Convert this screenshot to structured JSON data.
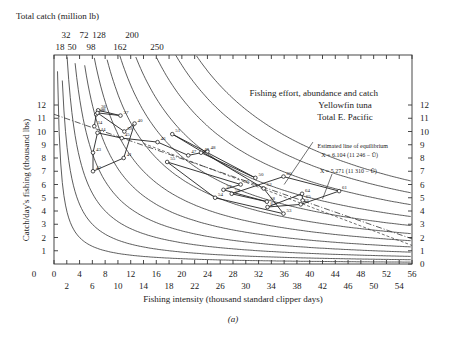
{
  "chart_data": {
    "type": "scatter",
    "title": "Fishing effort, abundance and catch",
    "subtitle": [
      "Yellowfin tuna",
      "Total E. Pacific"
    ],
    "xlabel": "Fishing intensity (thousand standard clipper days)",
    "ylabel": "Catch/day's fishing (thousand lbs)",
    "top_axis_label": "Total catch (million lb)",
    "caption": "(a)",
    "xlim": [
      0,
      56
    ],
    "ylim": [
      0,
      12.5
    ],
    "x_ticks_major_row1": [
      "0",
      "4",
      "8",
      "12",
      "16",
      "20",
      "24",
      "28",
      "32",
      "36",
      "40",
      "44",
      "48",
      "52",
      "56"
    ],
    "x_ticks_major_row2": [
      "2",
      "6",
      "10",
      "14",
      "18",
      "22",
      "26",
      "30",
      "34",
      "38",
      "42",
      "46",
      "50",
      "54"
    ],
    "y_ticks_left": [
      "1",
      "2",
      "3",
      "4",
      "5",
      "6",
      "7",
      "8",
      "9",
      "10",
      "11",
      "12"
    ],
    "y_ticks_right": [
      "0",
      "1",
      "2",
      "3",
      "4",
      "5",
      "6",
      "7",
      "8",
      "9",
      "10",
      "11",
      "12"
    ],
    "top_ticks_row1": [
      "32",
      "72",
      "128",
      "200"
    ],
    "top_ticks_row2": [
      "18",
      "50",
      "98",
      "162",
      "250"
    ],
    "isopleths_total_catch": [
      8,
      18,
      32,
      50,
      72,
      98,
      128,
      162,
      200,
      250,
      300,
      350
    ],
    "equilibrium_lines": {
      "title": "Estimated line of equilibrium",
      "line1": "X = 6.104 (11 246 − Ū)",
      "line2": "X = 5.271 (11 310 − Ū)"
    },
    "points": [
      {
        "year": "34",
        "x": 6.3,
        "y": 10.4
      },
      {
        "year": "35",
        "x": 6.6,
        "y": 11.3
      },
      {
        "year": "36",
        "x": 6.9,
        "y": 11.6
      },
      {
        "year": "37",
        "x": 10.4,
        "y": 11.2
      },
      {
        "year": "38",
        "x": 6.8,
        "y": 11.4
      },
      {
        "year": "39",
        "x": 11.0,
        "y": 10.0
      },
      {
        "year": "40",
        "x": 12.6,
        "y": 10.6
      },
      {
        "year": "41",
        "x": 10.9,
        "y": 8.0
      },
      {
        "year": "42",
        "x": 6.1,
        "y": 7.0
      },
      {
        "year": "43",
        "x": 6.1,
        "y": 8.4
      },
      {
        "year": "44",
        "x": 6.8,
        "y": 9.9
      },
      {
        "year": "45",
        "x": 10.6,
        "y": 9.5
      },
      {
        "year": "46",
        "x": 16.2,
        "y": 9.2
      },
      {
        "year": "47",
        "x": 21.0,
        "y": 8.2
      },
      {
        "year": "48",
        "x": 24.0,
        "y": 8.5
      },
      {
        "year": "49",
        "x": 23.0,
        "y": 8.4
      },
      {
        "year": "50",
        "x": 31.5,
        "y": 6.5
      },
      {
        "year": "51",
        "x": 18.5,
        "y": 9.8
      },
      {
        "year": "52",
        "x": 32.8,
        "y": 5.7
      },
      {
        "year": "53",
        "x": 35.9,
        "y": 3.8
      },
      {
        "year": "54",
        "x": 25.2,
        "y": 5.0
      },
      {
        "year": "55",
        "x": 17.7,
        "y": 7.7
      },
      {
        "year": "56",
        "x": 29.2,
        "y": 6.0
      },
      {
        "year": "57",
        "x": 26.5,
        "y": 5.6
      },
      {
        "year": "58",
        "x": 33.3,
        "y": 4.7
      },
      {
        "year": "59",
        "x": 27.8,
        "y": 5.3
      },
      {
        "year": "60",
        "x": 35.9,
        "y": 6.6
      },
      {
        "year": "61",
        "x": 44.6,
        "y": 5.5
      },
      {
        "year": "62",
        "x": 38.6,
        "y": 4.5
      },
      {
        "year": "63",
        "x": 33.4,
        "y": 4.3
      },
      {
        "year": "64",
        "x": 38.8,
        "y": 5.3
      },
      {
        "year": "65",
        "x": 38.9,
        "y": 4.8
      }
    ],
    "sequence_path": [
      "34",
      "35",
      "36",
      "37",
      "38",
      "39",
      "40",
      "41",
      "42",
      "43",
      "44",
      "45",
      "46",
      "47",
      "48",
      "49",
      "50",
      "51",
      "52",
      "53",
      "54",
      "55",
      "56",
      "57",
      "58",
      "59",
      "60",
      "61",
      "62",
      "63",
      "64",
      "65"
    ],
    "legend_position": "none",
    "grid": false
  }
}
